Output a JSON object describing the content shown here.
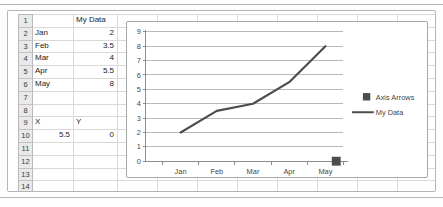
{
  "colors": {
    "series": "#4d4d4d",
    "gridline": "#b8b8b8",
    "axis": "#8c8c8c",
    "chart_text": "#474747",
    "sheet_gridline": "#d9d9d9",
    "header_fill": "#e9e9e9",
    "cell_text": "#1c1c1c"
  },
  "sheet": {
    "row_numbers": [
      "1",
      "2",
      "3",
      "4",
      "5",
      "6",
      "7",
      "8",
      "9",
      "10",
      "11",
      "12",
      "13",
      "14"
    ],
    "rows": [
      {
        "row": 1,
        "cells": [
          {
            "col": "B",
            "text": "My Data",
            "align": "left"
          }
        ]
      },
      {
        "row": 2,
        "cells": [
          {
            "col": "A",
            "text": "Jan",
            "align": "left"
          },
          {
            "col": "B",
            "text": "2",
            "align": "right"
          }
        ]
      },
      {
        "row": 3,
        "cells": [
          {
            "col": "A",
            "text": "Feb",
            "align": "left"
          },
          {
            "col": "B",
            "text": "3.5",
            "align": "right"
          }
        ]
      },
      {
        "row": 4,
        "cells": [
          {
            "col": "A",
            "text": "Mar",
            "align": "left"
          },
          {
            "col": "B",
            "text": "4",
            "align": "right"
          }
        ]
      },
      {
        "row": 5,
        "cells": [
          {
            "col": "A",
            "text": "Apr",
            "align": "left"
          },
          {
            "col": "B",
            "text": "5.5",
            "align": "right"
          }
        ]
      },
      {
        "row": 6,
        "cells": [
          {
            "col": "A",
            "text": "May",
            "align": "left"
          },
          {
            "col": "B",
            "text": "8",
            "align": "right"
          }
        ]
      },
      {
        "row": 9,
        "cells": [
          {
            "col": "A",
            "text": "X",
            "align": "left"
          },
          {
            "col": "B",
            "text": "Y",
            "align": "left"
          }
        ]
      },
      {
        "row": 10,
        "cells": [
          {
            "col": "A",
            "text": "5.5",
            "align": "right"
          },
          {
            "col": "B",
            "text": "0",
            "align": "right"
          }
        ]
      }
    ]
  },
  "chart_data": {
    "type": "line",
    "categories": [
      "Jan",
      "Feb",
      "Mar",
      "Apr",
      "May"
    ],
    "series": [
      {
        "name": "My Data",
        "type": "line",
        "values": [
          2,
          3.5,
          4,
          5.5,
          8
        ]
      },
      {
        "name": "Axis Arrows",
        "type": "scatter",
        "points": [
          {
            "x": 5.5,
            "y": 0
          }
        ]
      }
    ],
    "ylim": [
      0,
      9
    ],
    "ytick_step": 1,
    "ytick_labels": [
      "0",
      "1",
      "2",
      "3",
      "4",
      "5",
      "6",
      "7",
      "8",
      "9"
    ],
    "grid": true,
    "legend_position": "right",
    "legend": [
      {
        "label": "Axis Arrows",
        "marker": "square"
      },
      {
        "label": "My Data",
        "marker": "line"
      }
    ]
  }
}
